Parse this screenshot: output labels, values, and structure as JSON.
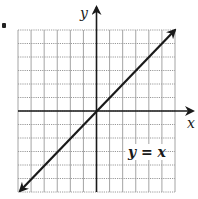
{
  "figure": {
    "bullet": "•",
    "axes": {
      "x_label": "x",
      "y_label": "y"
    },
    "line_label": "y = x",
    "colors": {
      "ink": "#1a1a1a",
      "grid": "#9a9a9a",
      "background": "#ffffff"
    }
  },
  "chart_data": {
    "type": "line",
    "title": "",
    "xlabel": "x",
    "ylabel": "y",
    "xlim": [
      -6,
      6
    ],
    "ylim": [
      -6,
      6
    ],
    "grid": true,
    "grid_step": 1,
    "legend": null,
    "annotations": [
      {
        "text": "y = x",
        "x": 3.5,
        "y": -3
      }
    ],
    "series": [
      {
        "name": "y = x",
        "x": [
          -6,
          0,
          6
        ],
        "y": [
          -6,
          0,
          6
        ],
        "arrows": "both"
      }
    ]
  }
}
